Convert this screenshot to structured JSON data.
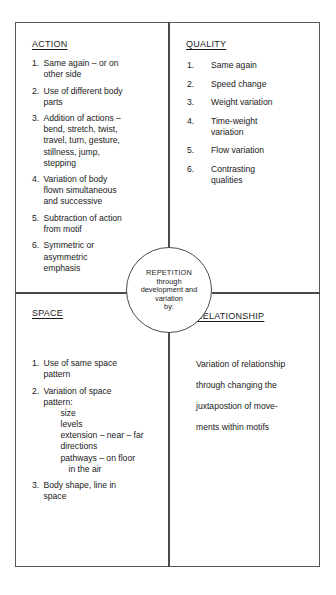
{
  "center": {
    "lines": [
      "REPETITION",
      "through",
      "development and",
      "variation",
      "by:"
    ]
  },
  "quadrants": {
    "action": {
      "heading": "ACTION",
      "items": [
        {
          "num": "1.",
          "lines": [
            "Same again – or on",
            "other side"
          ]
        },
        {
          "num": "2.",
          "lines": [
            "Use of different body",
            "parts"
          ]
        },
        {
          "num": "3.",
          "lines": [
            "Addition of actions –",
            "bend, stretch, twist,",
            "travel, turn, gesture,",
            "stillness, jump,",
            "stepping"
          ]
        },
        {
          "num": "4.",
          "lines": [
            "Variation of body",
            "flown simultaneous",
            "and successive"
          ]
        },
        {
          "num": "5.",
          "lines": [
            "Subtraction of action",
            "from motif"
          ]
        },
        {
          "num": "6.",
          "lines": [
            "Symmetric or",
            "asymmetric",
            "emphasis"
          ]
        }
      ]
    },
    "quality": {
      "heading": "QUALITY",
      "items": [
        {
          "num": "1.",
          "lines": [
            "Same again"
          ]
        },
        {
          "num": "2.",
          "lines": [
            "Speed change"
          ]
        },
        {
          "num": "3.",
          "lines": [
            "Weight variation"
          ]
        },
        {
          "num": "4.",
          "lines": [
            "Time-weight",
            "variation"
          ]
        },
        {
          "num": "5.",
          "lines": [
            "Flow variation"
          ]
        },
        {
          "num": "6.",
          "lines": [
            "Contrasting",
            "qualities"
          ]
        }
      ]
    },
    "space": {
      "heading": "SPACE",
      "items": [
        {
          "num": "1.",
          "lines": [
            "Use of same space",
            "pattern"
          ]
        },
        {
          "num": "2.",
          "lines": [
            "Variation of space",
            "pattern:"
          ],
          "sub": [
            {
              "text": "size",
              "indent": false
            },
            {
              "text": "levels",
              "indent": false
            },
            {
              "text": "extension – near – far",
              "indent": false
            },
            {
              "text": "directions",
              "indent": false
            },
            {
              "text": "pathways – on floor",
              "indent": false
            },
            {
              "text": "in the air",
              "indent": true
            }
          ]
        },
        {
          "num": "3.",
          "lines": [
            "Body shape, line in",
            "space"
          ]
        }
      ]
    },
    "relationship": {
      "heading": "RELATIONSHIP",
      "body_lines": [
        "Variation of relationship",
        "through changing the",
        "juxtapostion of move-",
        "ments within motifs"
      ]
    }
  }
}
